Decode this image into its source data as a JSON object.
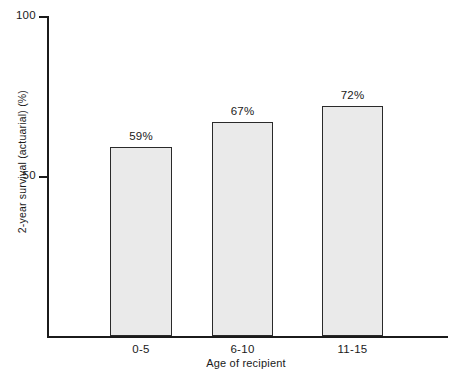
{
  "chart_data": {
    "type": "bar",
    "title": "",
    "categories": [
      "0-5",
      "6-10",
      "11-15"
    ],
    "values": [
      59,
      67,
      72
    ],
    "data_labels": [
      "59%",
      "67%",
      "72%"
    ],
    "xlabel": "Age of recipient",
    "ylabel": "2-year survival (actuarial) (%)",
    "ylim": [
      0,
      100
    ],
    "ytick_labels": [
      "100",
      "50"
    ],
    "ytick_values": [
      100,
      50
    ],
    "grid": false,
    "legend": "none",
    "bar_fill_color": "#eaeaea",
    "bar_border_color": "#2a2a2a",
    "axis_color": "#1b1b1b",
    "background_color": "#ffffff"
  },
  "axes": {
    "y_title": "2-year survival (actuarial) (%)",
    "x_title": "Age of recipient",
    "ticks": {
      "top": "100",
      "middle": "50"
    }
  },
  "bars": [
    {
      "category": "0-5",
      "label": "59%",
      "value": 59
    },
    {
      "category": "6-10",
      "label": "67%",
      "value": 67
    },
    {
      "category": "11-15",
      "label": "72%",
      "value": 72
    }
  ]
}
